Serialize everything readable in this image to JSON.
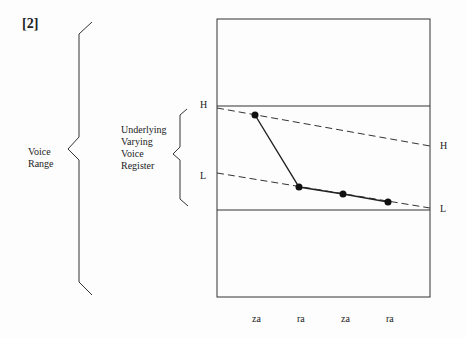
{
  "figure": {
    "number": "[2]"
  },
  "labels": {
    "voice_range": [
      "Voice",
      "Range"
    ],
    "register": [
      "Underlying",
      "Varying",
      "Voice",
      "Register"
    ],
    "left_high": "H",
    "left_low": "L",
    "right_high": "H",
    "right_low": "L"
  },
  "syllables": [
    "za",
    "ra",
    "za",
    "ra"
  ],
  "colors": {
    "line": "#222222",
    "background": "#fdfdfd"
  }
}
